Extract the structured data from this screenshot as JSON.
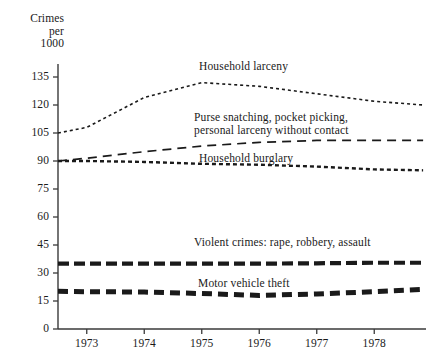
{
  "chart_data": {
    "type": "line",
    "title": "",
    "ylabel": "Crimes\nper\n1000",
    "ylabel_lines": [
      "Crimes",
      "per",
      "1000"
    ],
    "xlabel": "",
    "ylim": [
      0,
      142
    ],
    "xlim": [
      1972.5,
      1978.9
    ],
    "yticks": [
      0,
      15,
      30,
      45,
      60,
      75,
      90,
      105,
      120,
      135
    ],
    "ytick_labels": [
      "0",
      "15",
      "30",
      "45",
      "60",
      "75",
      "90",
      "105",
      "120",
      "135"
    ],
    "xticks": [
      1973,
      1974,
      1975,
      1976,
      1977,
      1978
    ],
    "xtick_labels": [
      "1973",
      "1974",
      "1975",
      "1976",
      "1977",
      "1978"
    ],
    "grid": false,
    "legend": "inline-annotations",
    "x": [
      1972.5,
      1973,
      1974,
      1975,
      1976,
      1977,
      1978,
      1978.85
    ],
    "series": [
      {
        "name": "household-larceny",
        "label": "Household larceny",
        "values": [
          105,
          108,
          124,
          132,
          130,
          126,
          122,
          120
        ],
        "color": "#1a1a1a",
        "dash": "3,3",
        "width": 1.6
      },
      {
        "name": "purse-snatching",
        "label": "Purse snatching, pocket picking,\npersonal larceny without contact",
        "label_lines": [
          "Purse snatching, pocket picking,",
          "personal larceny without contact"
        ],
        "values": [
          90,
          91.5,
          95,
          98,
          100,
          101,
          101,
          101
        ],
        "color": "#1a1a1a",
        "dash": "9,6",
        "width": 1.7
      },
      {
        "name": "household-burglary",
        "label": "Household burglary",
        "values": [
          90,
          90,
          89.5,
          88.5,
          88,
          87,
          85.5,
          85
        ],
        "color": "#1a1a1a",
        "dash": "4,3",
        "width": 2.4
      },
      {
        "name": "violent-crimes",
        "label": "Violent crimes: rape, robbery, assault",
        "values": [
          35,
          35,
          35,
          35,
          35,
          35.2,
          35.5,
          35.5
        ],
        "color": "#1a1a1a",
        "dash": "11,5",
        "width": 4.2
      },
      {
        "name": "motor-vehicle-theft",
        "label": "Motor vehicle theft",
        "values": [
          20.2,
          20,
          19.8,
          19,
          18,
          18.8,
          20,
          21.2
        ],
        "color": "#1a1a1a",
        "dash": "10,6",
        "width": 5.0
      }
    ],
    "annotations": [
      {
        "name": "household-larceny",
        "text": "Household larceny",
        "x": 199,
        "y": 60
      },
      {
        "name": "purse-snatching",
        "text": "Purse snatching, pocket picking,\npersonal larceny without contact",
        "x": 194,
        "y": 111
      },
      {
        "name": "household-burglary",
        "text": "Household burglary",
        "x": 199,
        "y": 152
      },
      {
        "name": "violent-crimes",
        "text": "Violent crimes: rape, robbery, assault",
        "x": 194,
        "y": 236
      },
      {
        "name": "motor-vehicle-theft",
        "text": "Motor vehicle theft",
        "x": 198,
        "y": 277
      }
    ]
  }
}
